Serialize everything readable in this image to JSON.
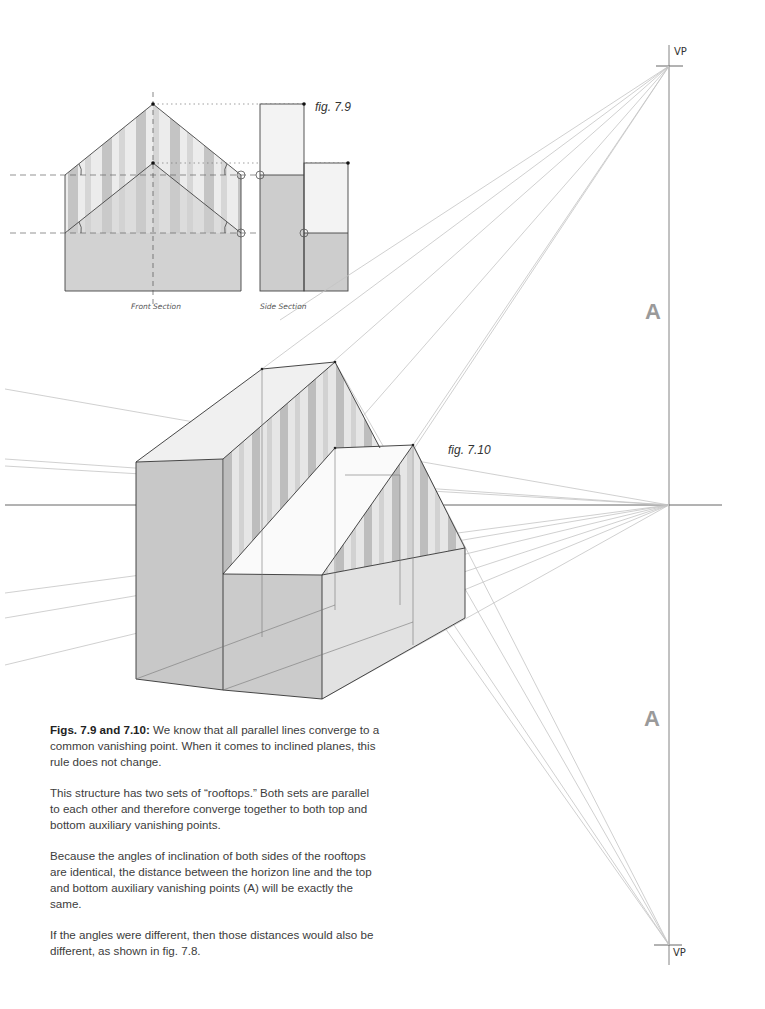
{
  "figures": {
    "fig_7_9": {
      "label": "fig. 7.9",
      "front_section_label": "Front Section",
      "side_section_label": "Side Section"
    },
    "fig_7_10": {
      "label": "fig. 7.10"
    }
  },
  "vanishing_points": {
    "top_label": "VP",
    "bottom_label": "VP",
    "aux_top_label": "A",
    "aux_bottom_label": "A"
  },
  "caption": {
    "lead_bold": "Figs. 7.9 and 7.10:",
    "p1_rest": " We know that all parallel lines converge to a common vanishing point. When it comes to inclined planes, this rule does not change.",
    "p2": "This structure has two sets of “rooftops.” Both sets are parallel to each other and therefore converge together to both top and bottom auxiliary vanishing points.",
    "p3": "Because the angles of inclination of both sides of the rooftops are identical, the distance between the horizon line and the top and bottom auxiliary vanishing points (A) will be exactly the same.",
    "p4": "If the angles were different, then those distances would also be different, as shown in fig. 7.8."
  },
  "colors": {
    "wall_dark": "#c9c9c9",
    "wall_light": "#e4e4e4",
    "roof_light": "#f4f4f4",
    "stripe": "#b8b8b8",
    "guide_line": "#bdbdbd",
    "edge_line": "#333333",
    "aux_letter": "#9a9a9a"
  }
}
